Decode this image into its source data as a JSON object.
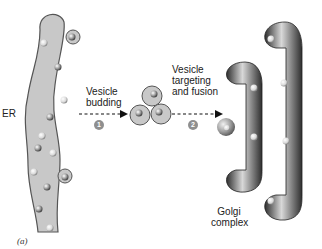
{
  "labels": {
    "er": "ER",
    "step1_label": "Vesicle budding",
    "step1_line1": "Vesicle",
    "step1_line2": "budding",
    "step1_number": "1",
    "step2_line1": "Vesicle",
    "step2_line2": "targeting",
    "step2_line3": "and fusion",
    "step2_number": "2",
    "golgi_line1": "Golgi",
    "golgi_line2": "complex",
    "figure_label": "(a)"
  },
  "colors": {
    "er_fill": "#c8c8c8",
    "er_stroke": "#555555",
    "golgi_dark": "#3a3a3a",
    "golgi_light": "#d6d6d6",
    "step_badge": "#8f8f8f",
    "arrow": "#111111"
  }
}
